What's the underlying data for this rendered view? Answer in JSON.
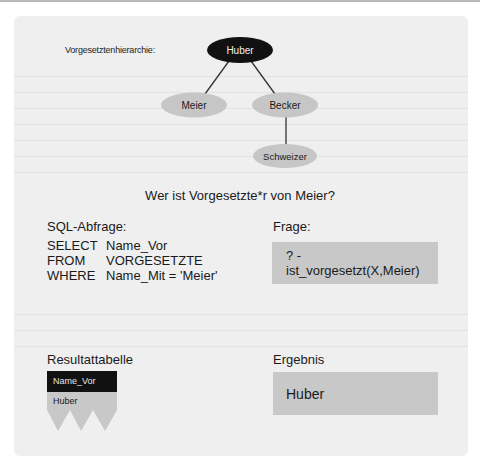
{
  "hierarchy": {
    "label": "Vorgesetztenhierarchie:",
    "nodes": [
      {
        "id": "huber",
        "label": "Huber",
        "fill": "#111111",
        "text_color": "#f0f0f0"
      },
      {
        "id": "meier",
        "label": "Meier",
        "fill": "#c6c6c6",
        "text_color": "#1a1a1a"
      },
      {
        "id": "becker",
        "label": "Becker",
        "fill": "#c6c6c6",
        "text_color": "#1a1a1a"
      },
      {
        "id": "schweizer",
        "label": "Schweizer",
        "fill": "#c6c6c6",
        "text_color": "#1a1a1a"
      }
    ],
    "edges": [
      [
        "huber",
        "meier"
      ],
      [
        "huber",
        "becker"
      ],
      [
        "becker",
        "schweizer"
      ]
    ]
  },
  "question": "Wer ist Vorgesetzte*r von Meier?",
  "sql": {
    "heading": "SQL-Abfrage:",
    "lines": [
      {
        "keyword": "SELECT",
        "value": "Name_Vor"
      },
      {
        "keyword": "FROM",
        "value": "VORGESETZTE"
      },
      {
        "keyword": "WHERE",
        "value": "Name_Mit = 'Meier'"
      }
    ]
  },
  "prolog": {
    "heading": "Frage:",
    "query": "? - ist_vorgesetzt(X,Meier)"
  },
  "result_table": {
    "heading": "Resultattabelle",
    "column": "Name_Vor",
    "rows": [
      "Huber"
    ]
  },
  "result": {
    "heading": "Ergebnis",
    "value": "Huber"
  },
  "colors": {
    "panel_bg": "#efefef",
    "box_gray": "#c8c8c8",
    "dark": "#111111"
  }
}
